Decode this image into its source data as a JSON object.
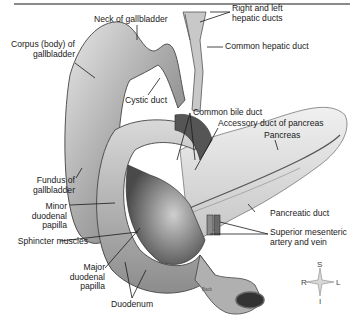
{
  "figure": {
    "labels": {
      "neck_of_gallbladder": "Neck of gallbladder",
      "right_left_hepatic_ducts_1": "Right and left",
      "right_left_hepatic_ducts_2": "hepatic ducts",
      "corpus_1": "Corpus (body) of",
      "corpus_2": "gallbladder",
      "common_hepatic_duct": "Common hepatic duct",
      "cystic_duct": "Cystic duct",
      "common_bile_duct": "Common bile duct",
      "accessory_duct": "Accessory duct of pancreas",
      "pancreas": "Pancreas",
      "fundus_1": "Fundus of",
      "fundus_2": "gallbladder",
      "minor_papilla_1": "Minor",
      "minor_papilla_2": "duodenal",
      "minor_papilla_3": "papilla",
      "pancreatic_duct": "Pancreatic duct",
      "sphincter_muscles": "Sphincter muscles",
      "sma_1": "Superior mesenteric",
      "sma_2": "artery and vein",
      "major_papilla_1": "Major",
      "major_papilla_2": "duodenal",
      "major_papilla_3": "papilla",
      "duodenum": "Duodenum",
      "back": "Back"
    },
    "compass": {
      "superior": "S",
      "inferior": "I",
      "right": "R",
      "left": "L"
    },
    "colors": {
      "line": "#1a1a1a",
      "organ_dark": "#6e6e6e",
      "organ_mid": "#b5b5b5",
      "organ_light": "#e2e2e2",
      "rule": "#8a8a8a"
    }
  }
}
